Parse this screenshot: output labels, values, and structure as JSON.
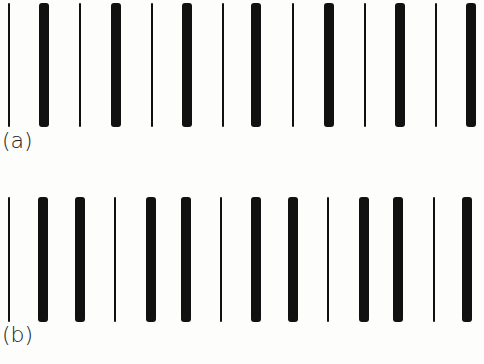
{
  "figure": {
    "panels": [
      {
        "label": "(a)",
        "pattern": [
          "thin",
          "thick",
          "thin",
          "thick",
          "thin",
          "thick",
          "thin",
          "thick",
          "thin",
          "thick",
          "thin",
          "thick",
          "thin",
          "thick"
        ],
        "positions": [
          9,
          44,
          80,
          116,
          152,
          187,
          223,
          256,
          293,
          329,
          365,
          400,
          436,
          471
        ],
        "top": 3,
        "height": 124,
        "label_top": 128
      },
      {
        "label": "(b)",
        "pattern": [
          "thin",
          "thick",
          "thick",
          "thin",
          "thick",
          "thick",
          "thin",
          "thick",
          "thick",
          "thin",
          "thick",
          "thick",
          "thin",
          "thick"
        ],
        "positions": [
          9,
          43,
          80,
          115,
          151,
          186,
          221,
          256,
          293,
          328,
          364,
          398,
          434,
          467
        ],
        "top": 197,
        "height": 125,
        "label_top": 322
      }
    ]
  }
}
